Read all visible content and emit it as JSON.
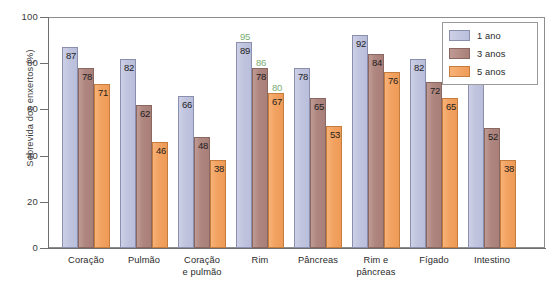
{
  "chart_data": {
    "type": "bar",
    "title": "",
    "xlabel": "",
    "ylabel": "Sobrevida dos enxertos (%)",
    "ylim": [
      0,
      100
    ],
    "yticks": [
      0,
      20,
      40,
      60,
      80,
      100
    ],
    "ytick_labels": [
      "0",
      "20",
      "40",
      "60",
      "80",
      "100"
    ],
    "grid": false,
    "legend_position": "top-right",
    "categories": [
      "Coração",
      "Pulmão",
      "Coração e pulmão",
      "Rim",
      "Pâncreas",
      "Rim e pâncreas",
      "Fígado",
      "Intestino"
    ],
    "category_lines": [
      [
        "Coração"
      ],
      [
        "Pulmão"
      ],
      [
        "Coração",
        "e pulmão"
      ],
      [
        "Rim"
      ],
      [
        "Pâncreas"
      ],
      [
        "Rim e",
        "pâncreas"
      ],
      [
        "Fígado"
      ],
      [
        "Intestino"
      ]
    ],
    "series": [
      {
        "name": "1 ano",
        "color": "#c0c4de",
        "values": [
          87,
          82,
          66,
          89,
          78,
          92,
          82,
          77
        ]
      },
      {
        "name": "3 anos",
        "color": "#ae857f",
        "values": [
          78,
          62,
          48,
          78,
          65,
          84,
          72,
          52
        ]
      },
      {
        "name": "5 anos",
        "color": "#f2a261",
        "values": [
          71,
          46,
          38,
          67,
          53,
          76,
          65,
          38
        ]
      }
    ],
    "annotations": [
      {
        "text": "95",
        "category": "Rim",
        "series": "1 ano",
        "color": "#5f9e5a",
        "note": "misregistered duplicate label"
      },
      {
        "text": "86",
        "category": "Rim",
        "series": "3 anos",
        "color": "#5f9e5a",
        "note": "misregistered duplicate label"
      },
      {
        "text": "80",
        "category": "Rim",
        "series": "5 anos",
        "color": "#5f9e5a",
        "note": "misregistered duplicate label"
      }
    ]
  },
  "legend": {
    "items": [
      {
        "label": "1 ano"
      },
      {
        "label": "3 anos"
      },
      {
        "label": "5 anos"
      }
    ]
  }
}
